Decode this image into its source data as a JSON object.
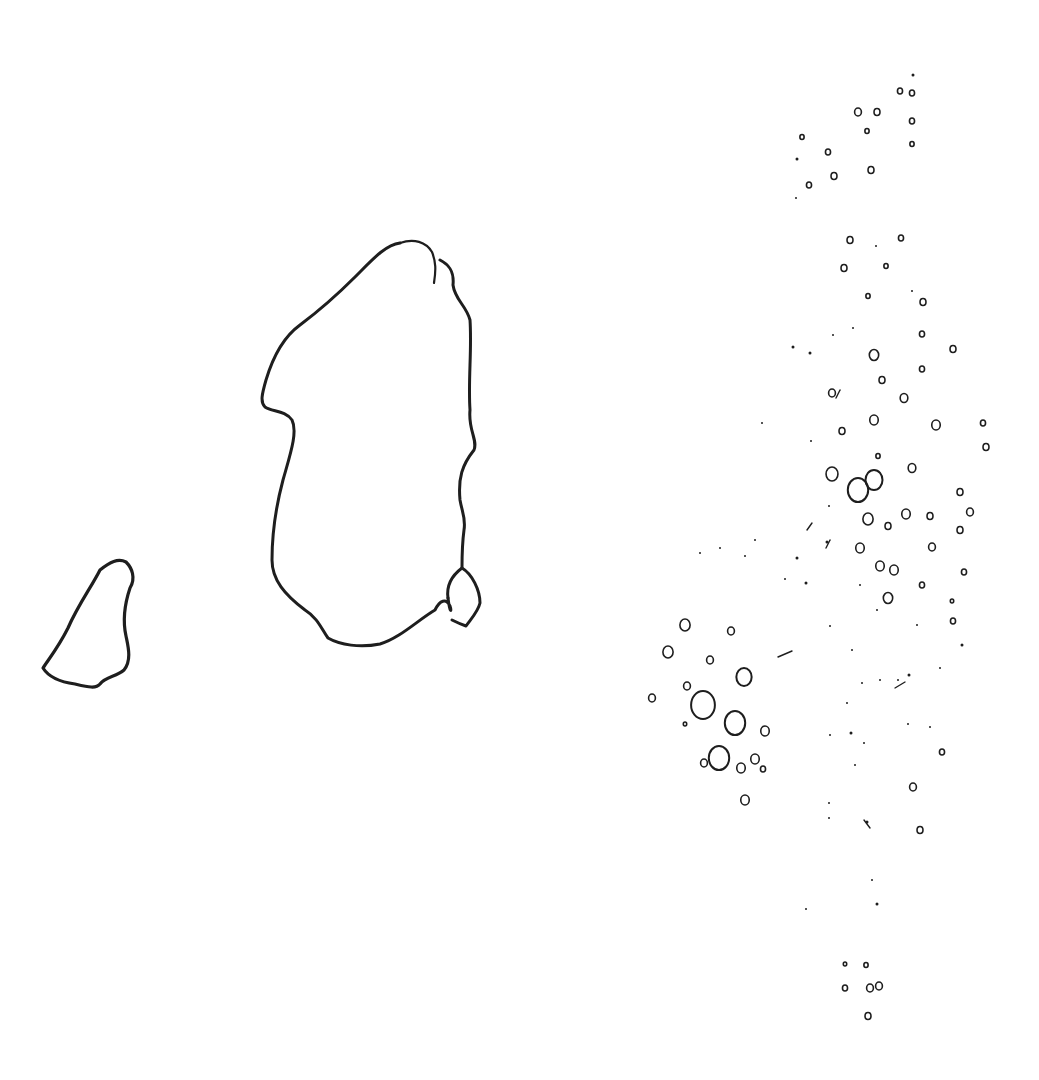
{
  "canvas": {
    "width": 1039,
    "height": 1080,
    "background": "#ffffff",
    "ink": "#1e1e1e"
  },
  "outlines": [
    {
      "name": "small-left-island",
      "width": 3.2,
      "d": "M100,570 C92,586 78,605 68,628 C58,648 48,660 43,668 C48,676 60,682 75,684 C88,687 96,689 100,684 C106,676 116,677 124,670 C132,660 128,646 126,636 C122,618 126,600 130,588 C136,578 132,568 126,562 C118,558 110,562 100,570 Z"
    },
    {
      "name": "large-central-island",
      "width": 3,
      "d": "M400,243 C385,245 372,260 355,277 C338,294 320,310 300,325 C282,338 272,360 266,380 C262,394 260,402 265,407 C272,412 285,410 292,420 C298,432 290,455 283,480 C275,510 272,540 272,560 C272,580 285,595 305,610 C318,618 322,630 328,638 C340,645 360,648 380,644 C400,638 418,620 435,610 C440,600 446,598 450,606 C452,612 450,614 448,598"
    },
    {
      "name": "large-island-right-coast",
      "width": 3,
      "d": "M440,260 C452,266 454,275 453,285 C455,300 466,305 470,320 C472,350 468,380 470,410 C468,430 478,440 474,450 C462,465 458,478 460,500 C462,512 466,518 464,530 C462,545 462,558 462,568"
    },
    {
      "name": "large-island-top-notch",
      "width": 2.2,
      "d": "M400,243 C414,238 426,242 432,252 C436,262 436,270 434,283"
    },
    {
      "name": "south-east-islet",
      "width": 3,
      "d": "M462,568 C472,574 480,590 480,603 C478,612 470,620 466,626 C460,624 456,622 452,620 M462,568 C454,574 446,584 448,598"
    }
  ],
  "dots": [
    [
      913,
      75,
      1.5
    ],
    [
      900,
      91,
      3
    ],
    [
      912,
      93,
      3
    ],
    [
      858,
      112,
      4
    ],
    [
      877,
      112,
      3.5
    ],
    [
      912,
      121,
      3
    ],
    [
      802,
      137,
      2.5
    ],
    [
      867,
      131,
      2.5
    ],
    [
      912,
      144,
      2.5
    ],
    [
      828,
      152,
      3
    ],
    [
      797,
      159,
      1.5
    ],
    [
      871,
      170,
      3.5
    ],
    [
      834,
      176,
      3.5
    ],
    [
      809,
      185,
      3
    ],
    [
      796,
      198,
      1
    ],
    [
      850,
      240,
      3.5
    ],
    [
      876,
      246,
      1
    ],
    [
      901,
      238,
      3
    ],
    [
      844,
      268,
      3.5
    ],
    [
      886,
      266,
      2.5
    ],
    [
      868,
      296,
      2.5
    ],
    [
      912,
      291,
      1
    ],
    [
      923,
      302,
      3.5
    ],
    [
      853,
      328,
      1
    ],
    [
      833,
      335,
      1
    ],
    [
      793,
      347,
      1.5
    ],
    [
      810,
      353,
      1.5
    ],
    [
      922,
      334,
      3
    ],
    [
      953,
      349,
      3.5
    ],
    [
      874,
      355,
      5.5
    ],
    [
      882,
      380,
      3.5
    ],
    [
      922,
      369,
      3
    ],
    [
      832,
      393,
      4
    ],
    [
      904,
      398,
      4.5
    ],
    [
      842,
      431,
      3.5
    ],
    [
      874,
      420,
      5
    ],
    [
      936,
      425,
      5
    ],
    [
      983,
      423,
      3
    ],
    [
      986,
      447,
      3.5
    ],
    [
      811,
      441,
      1
    ],
    [
      762,
      423,
      1
    ],
    [
      878,
      456,
      2.5
    ],
    [
      912,
      468,
      4.5
    ],
    [
      960,
      492,
      3.5
    ],
    [
      832,
      474,
      7
    ],
    [
      858,
      490,
      12
    ],
    [
      874,
      480,
      10
    ],
    [
      868,
      519,
      6
    ],
    [
      888,
      526,
      3.5
    ],
    [
      906,
      514,
      5
    ],
    [
      930,
      516,
      3.5
    ],
    [
      970,
      512,
      4
    ],
    [
      960,
      530,
      3.5
    ],
    [
      860,
      548,
      5
    ],
    [
      880,
      566,
      5
    ],
    [
      894,
      570,
      5
    ],
    [
      932,
      547,
      4
    ],
    [
      964,
      572,
      3
    ],
    [
      922,
      585,
      3
    ],
    [
      888,
      598,
      5.5
    ],
    [
      952,
      601,
      2
    ],
    [
      953,
      621,
      3
    ],
    [
      962,
      645,
      1.5
    ],
    [
      685,
      625,
      6
    ],
    [
      731,
      631,
      4
    ],
    [
      668,
      652,
      6
    ],
    [
      710,
      660,
      4
    ],
    [
      744,
      677,
      9
    ],
    [
      652,
      698,
      4
    ],
    [
      687,
      686,
      4
    ],
    [
      703,
      705,
      14
    ],
    [
      735,
      723,
      12
    ],
    [
      765,
      731,
      5
    ],
    [
      685,
      724,
      2
    ],
    [
      719,
      758,
      12
    ],
    [
      741,
      768,
      5
    ],
    [
      755,
      759,
      5
    ],
    [
      763,
      769,
      3
    ],
    [
      704,
      763,
      4
    ],
    [
      745,
      800,
      5
    ],
    [
      827,
      542,
      1.5
    ],
    [
      829,
      506,
      1
    ],
    [
      797,
      558,
      1.5
    ],
    [
      755,
      540,
      1
    ],
    [
      745,
      556,
      1
    ],
    [
      700,
      553,
      1
    ],
    [
      720,
      548,
      1
    ],
    [
      785,
      579,
      1
    ],
    [
      806,
      583,
      1.5
    ],
    [
      860,
      585,
      1
    ],
    [
      877,
      610,
      1
    ],
    [
      917,
      625,
      1
    ],
    [
      830,
      626,
      1
    ],
    [
      852,
      650,
      1
    ],
    [
      862,
      683,
      1
    ],
    [
      880,
      680,
      1
    ],
    [
      898,
      680,
      1
    ],
    [
      909,
      675,
      1.5
    ],
    [
      940,
      668,
      1
    ],
    [
      847,
      703,
      1
    ],
    [
      851,
      733,
      1.5
    ],
    [
      830,
      735,
      1
    ],
    [
      864,
      743,
      1
    ],
    [
      908,
      724,
      1
    ],
    [
      930,
      727,
      1
    ],
    [
      942,
      752,
      3
    ],
    [
      855,
      765,
      1
    ],
    [
      913,
      787,
      4
    ],
    [
      829,
      803,
      1
    ],
    [
      829,
      818,
      1
    ],
    [
      867,
      822,
      1.5
    ],
    [
      920,
      830,
      3.5
    ],
    [
      872,
      880,
      1
    ],
    [
      877,
      904,
      1.5
    ],
    [
      806,
      909,
      1
    ],
    [
      845,
      964,
      2
    ],
    [
      866,
      965,
      2.5
    ],
    [
      845,
      988,
      3
    ],
    [
      870,
      988,
      4
    ],
    [
      879,
      986,
      4
    ],
    [
      868,
      1016,
      3.5
    ]
  ],
  "ticks": [
    [
      778,
      657,
      792,
      651
    ],
    [
      807,
      530,
      812,
      523
    ],
    [
      826,
      548,
      830,
      540
    ],
    [
      895,
      688,
      905,
      682
    ],
    [
      864,
      820,
      870,
      828
    ],
    [
      840,
      390,
      836,
      398
    ]
  ]
}
